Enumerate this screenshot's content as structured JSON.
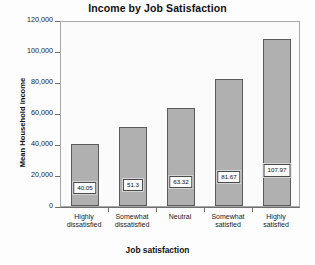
{
  "chart_data": {
    "type": "bar",
    "title": "Income by Job Satisfaction",
    "xlabel": "Job satisfaction",
    "ylabel": "Mean Household income",
    "categories": [
      "Highly\ndissatisfied",
      "Somewhat\ndissatisfied",
      "Neutral",
      "Somewhat\nsatisfied",
      "Highly\nsatisfied"
    ],
    "values": [
      40050,
      51300,
      63320,
      81670,
      107970
    ],
    "data_labels": [
      "40.05",
      "51.3",
      "63.32",
      "81.67",
      "107.97"
    ],
    "ylim": [
      0,
      120000
    ],
    "ytick_labels": [
      "120,000",
      "100,000",
      "80,000",
      "60,000",
      "40,000",
      "20,000",
      "0"
    ],
    "ytick_values": [
      120000,
      100000,
      80000,
      60000,
      40000,
      20000,
      0
    ],
    "grid": false,
    "legend": null,
    "colors": {
      "bar_fill": "#b0b0b0",
      "bar_border": "#5a5a5a",
      "plot_background": "#fbfbfb",
      "frame": "#a8a8a8",
      "text": "#1a1a1a"
    }
  }
}
